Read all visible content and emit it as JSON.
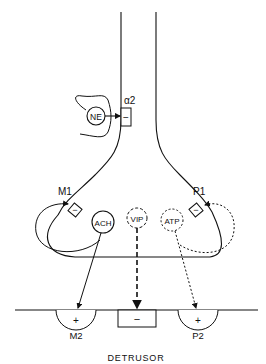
{
  "diagram": {
    "title": "DETRUSOR",
    "transmitters": [
      {
        "id": "ne",
        "label": "NE",
        "style": "solid"
      },
      {
        "id": "ach",
        "label": "ACH",
        "style": "solid"
      },
      {
        "id": "vip",
        "label": "VIP",
        "style": "dashed"
      },
      {
        "id": "atp",
        "label": "ATP",
        "style": "dotted"
      }
    ],
    "prejunctional_receptors": [
      {
        "id": "alpha2",
        "label": "α2",
        "sign": "−"
      },
      {
        "id": "m1",
        "label": "M1",
        "sign": "−"
      },
      {
        "id": "p1",
        "label": "P1",
        "sign": "−"
      }
    ],
    "postjunctional_receptors": [
      {
        "id": "m2",
        "label": "M2",
        "sign": "+"
      },
      {
        "id": "vip-receptor",
        "label": "",
        "sign": "−"
      },
      {
        "id": "p2",
        "label": "P2",
        "sign": "+"
      }
    ],
    "colors": {
      "ink": "#111111",
      "background": "#ffffff"
    }
  }
}
